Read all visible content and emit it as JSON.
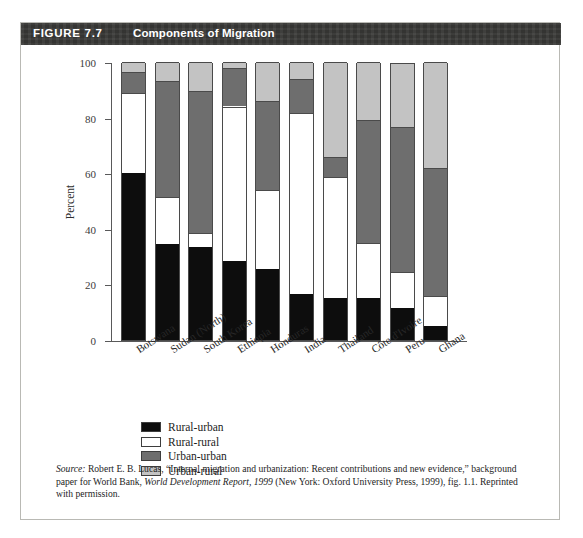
{
  "figure": {
    "number_label": "FIGURE 7.7",
    "title": "Components of Migration"
  },
  "chart_data": {
    "type": "bar",
    "stacked": true,
    "title": "Components of Migration",
    "xlabel": "",
    "ylabel": "Percent",
    "ylim": [
      0,
      100
    ],
    "yticks": [
      0,
      20,
      40,
      60,
      80,
      100
    ],
    "grid": false,
    "legend_position": "below-plot-left",
    "categories": [
      "Botswana",
      "Sudan (North)",
      "South Korea",
      "Ethiopia",
      "Honduras",
      "India",
      "Thailand",
      "Côte d'Ivoire",
      "Peru",
      "Ghana"
    ],
    "series": [
      {
        "name": "Rural-urban",
        "color": "#0d0d0d",
        "values": [
          60,
          34.5,
          33.5,
          28.5,
          25.5,
          16.5,
          15,
          15,
          11.5,
          5
        ]
      },
      {
        "name": "Rural-rural",
        "color": "#ffffff",
        "values": [
          29,
          17,
          5,
          55.5,
          28.5,
          65,
          43.5,
          20,
          13,
          11
        ]
      },
      {
        "name": "Urban-urban",
        "color": "#6e6e6e",
        "values": [
          7.5,
          41.5,
          51,
          14,
          32,
          12.5,
          7.5,
          44,
          52,
          46
        ]
      },
      {
        "name": "Urban-rural",
        "color": "#c3c3c3",
        "values": [
          3.5,
          7,
          10.5,
          2,
          14,
          6,
          34,
          21,
          23,
          38
        ]
      }
    ],
    "cumulative_tops": [
      [
        60,
        89,
        96.5,
        100
      ],
      [
        34.5,
        51.5,
        93,
        100
      ],
      [
        33.5,
        38.5,
        89.5,
        100
      ],
      [
        28.5,
        84,
        98,
        100
      ],
      [
        25.5,
        54,
        86,
        100
      ],
      [
        16.5,
        81.5,
        94,
        100
      ],
      [
        15,
        58.5,
        66,
        100
      ],
      [
        15,
        35,
        79,
        100
      ],
      [
        11.5,
        24.5,
        76.5,
        100
      ],
      [
        5,
        16,
        62,
        100
      ]
    ]
  },
  "legend": {
    "items": [
      {
        "label": "Rural-urban",
        "swatch": "#0d0d0d"
      },
      {
        "label": "Rural-rural",
        "swatch": "#ffffff"
      },
      {
        "label": "Urban-urban",
        "swatch": "#6e6e6e"
      },
      {
        "label": "Urban-rural",
        "swatch": "#c3c3c3"
      }
    ]
  },
  "source": {
    "label": "Source:",
    "text_part1": " Robert E. B. Lucas, “Internal migration and urbanization: Recent contributions and new evidence,” background paper for World Bank, ",
    "italic_part": "World Development Report, 1999",
    "text_part2": " (New York: Oxford University Press, 1999), fig. 1.1. Reprinted with permission."
  }
}
